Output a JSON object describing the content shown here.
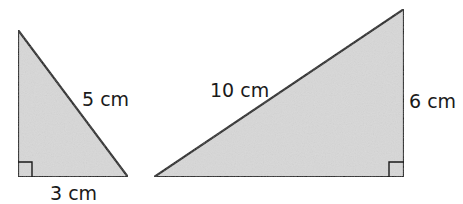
{
  "colors": {
    "fill": "#d8d8d8",
    "stroke": "#1a1a1a",
    "background": "#ffffff"
  },
  "triangles": [
    {
      "id": "left",
      "right_angle_at": "bottom-left",
      "labels": {
        "hypotenuse": "5 cm",
        "base": "3 cm"
      }
    },
    {
      "id": "right",
      "right_angle_at": "bottom-right",
      "labels": {
        "hypotenuse": "10 cm",
        "height": "6 cm"
      }
    }
  ]
}
